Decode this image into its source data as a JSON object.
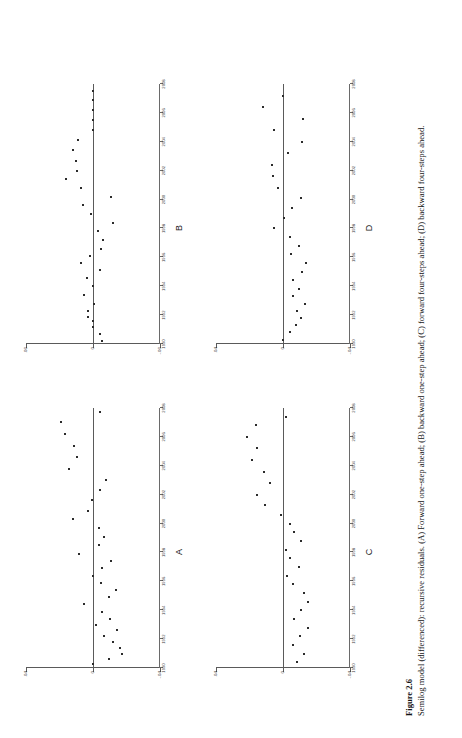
{
  "figure": {
    "number_label": "Figure 2.6",
    "caption": "Semilog model (differenced): recursive residuals. (A) Forward one-step ahead; (B) backward one-step ahead; (C) forward four-steps ahead; (D) backward four-steps ahead."
  },
  "chart_data": [
    {
      "type": "scatter",
      "title": "A",
      "subtitle": "Forward one-step ahead",
      "xlabel": "",
      "ylabel": "",
      "xlim": [
        1990,
        2008
      ],
      "ylim": [
        -0.04,
        0.04
      ],
      "xticks": [
        1990,
        1992,
        1994,
        1996,
        1998,
        2000,
        2002,
        2004,
        2006,
        2008
      ],
      "xticklabels": [
        "1990",
        "1992",
        "1994",
        "1996",
        "1998",
        "2000",
        "2002",
        "2004",
        "2006",
        "2008"
      ],
      "yticks": [
        -0.04,
        0,
        0.04
      ],
      "yticklabels": [
        "-.04",
        "0",
        ".04"
      ],
      "grid": false,
      "zero_line": 0,
      "x": [
        1990.3,
        1990.6,
        1991.0,
        1991.4,
        1991.8,
        1992.2,
        1992.6,
        1993.0,
        1993.4,
        1993.9,
        1994.4,
        1994.9,
        1995.4,
        1995.9,
        1996.4,
        1996.9,
        1997.4,
        1997.9,
        1998.5,
        1999.1,
        1999.7,
        2000.3,
        2000.9,
        2001.6,
        2002.3,
        2003.0,
        2003.8,
        2004.6,
        2005.4,
        2006.2,
        2007.0,
        2007.7
      ],
      "y": [
        0.0,
        -0.0098,
        -0.0172,
        -0.016,
        -0.012,
        -0.0066,
        -0.0142,
        -0.002,
        -0.0102,
        -0.0056,
        0.0056,
        -0.0094,
        -0.0136,
        -0.0046,
        0.0,
        -0.0054,
        -0.011,
        0.0082,
        -0.0038,
        -0.0066,
        -0.0036,
        0.012,
        0.003,
        0.0004,
        -0.004,
        -0.008,
        0.0146,
        0.0098,
        0.0112,
        0.017,
        0.019,
        -0.004
      ]
    },
    {
      "type": "scatter",
      "title": "B",
      "subtitle": "Backward one-step ahead",
      "xlabel": "",
      "ylabel": "",
      "xlim": [
        1990,
        2008
      ],
      "ylim": [
        -0.06,
        0.06
      ],
      "xticks": [
        1990,
        1992,
        1994,
        1996,
        1998,
        2000,
        2002,
        2004,
        2006,
        2008
      ],
      "xticklabels": [
        "1990",
        "1992",
        "1994",
        "1996",
        "1998",
        "2000",
        "2002",
        "2004",
        "2006",
        "2008"
      ],
      "yticks": [
        -0.06,
        0,
        0.06
      ],
      "yticklabels": [
        "-.06",
        "0",
        ".06"
      ],
      "grid": false,
      "zero_line": 0,
      "x": [
        1990.2,
        1990.7,
        1991.2,
        1991.6,
        1991.9,
        1992.3,
        1992.8,
        1993.4,
        1994.0,
        1994.6,
        1995.1,
        1995.6,
        1996.1,
        1996.6,
        1997.2,
        1997.8,
        1998.4,
        1999.0,
        1999.6,
        2000.2,
        2000.8,
        2001.4,
        2002.0,
        2002.7,
        2003.4,
        2004.1,
        2004.8,
        2005.5,
        2006.2,
        2006.9,
        2007.5
      ],
      "y": [
        -0.0078,
        -0.0066,
        -0.0004,
        -0.0004,
        0.0044,
        0.0048,
        -0.001,
        0.0084,
        0.0,
        0.0054,
        -0.0064,
        0.011,
        0.0026,
        -0.0074,
        -0.0094,
        -0.0046,
        -0.0178,
        0.0014,
        0.0092,
        -0.016,
        0.0108,
        0.0238,
        0.0146,
        0.015,
        0.018,
        0.013,
        0.0,
        0.0,
        0.0,
        0.0,
        0.0
      ]
    },
    {
      "type": "scatter",
      "title": "C",
      "subtitle": "Forward four-steps ahead",
      "xlabel": "",
      "ylabel": "",
      "xlim": [
        1990,
        2008
      ],
      "ylim": [
        -0.04,
        0.04
      ],
      "xticks": [
        1990,
        1992,
        1994,
        1996,
        1998,
        2000,
        2002,
        2004,
        2006,
        2008
      ],
      "xticklabels": [
        "1990",
        "1992",
        "1994",
        "1996",
        "1998",
        "2000",
        "2002",
        "2004",
        "2006",
        "2008"
      ],
      "yticks": [
        -0.04,
        0,
        0.04
      ],
      "yticklabels": [
        "-.04",
        "0",
        ".04"
      ],
      "grid": false,
      "zero_line": 0,
      "x": [
        1990.4,
        1991.0,
        1991.6,
        1992.2,
        1992.8,
        1993.4,
        1994.0,
        1994.6,
        1995.2,
        1995.8,
        1996.4,
        1997.0,
        1997.6,
        1998.2,
        1998.8,
        1999.4,
        2000.0,
        2000.6,
        2001.3,
        2002.0,
        2002.8,
        2003.6,
        2004.4,
        2005.2,
        2006.0,
        2006.8,
        2007.4
      ],
      "y": [
        -0.0086,
        -0.0124,
        -0.006,
        -0.01,
        -0.0148,
        -0.0068,
        -0.0108,
        -0.0148,
        -0.0128,
        -0.0062,
        -0.0022,
        -0.0096,
        -0.0044,
        -0.002,
        -0.0108,
        -0.0064,
        -0.004,
        0.0012,
        0.011,
        0.0154,
        0.008,
        0.0112,
        0.0184,
        0.0156,
        0.0212,
        0.0164,
        -0.002
      ]
    },
    {
      "type": "scatter",
      "title": "D",
      "subtitle": "Backward four-steps ahead",
      "xlabel": "",
      "ylabel": "",
      "xlim": [
        1990,
        2008
      ],
      "ylim": [
        -0.04,
        0.04
      ],
      "xticks": [
        1990,
        1992,
        1994,
        1996,
        1998,
        2000,
        2002,
        2004,
        2006,
        2008
      ],
      "xticklabels": [
        "1990",
        "1992",
        "1994",
        "1996",
        "1998",
        "2000",
        "2002",
        "2004",
        "2006",
        "2008"
      ],
      "yticks": [
        -0.04,
        0,
        0.04
      ],
      "yticklabels": [
        "-.04",
        "0",
        ".04"
      ],
      "grid": false,
      "zero_line": 0,
      "x": [
        1990.3,
        1990.8,
        1991.3,
        1991.8,
        1992.3,
        1992.8,
        1993.3,
        1993.8,
        1994.4,
        1995.0,
        1995.6,
        1996.2,
        1996.8,
        1997.4,
        1998.0,
        1998.7,
        1999.4,
        2000.1,
        2000.8,
        2001.6,
        2002.4,
        2003.2,
        2004.0,
        2004.8,
        2005.6,
        2006.4,
        2007.2
      ],
      "y": [
        0.0,
        -0.0042,
        -0.0076,
        -0.0108,
        -0.0084,
        -0.0132,
        -0.0062,
        -0.0096,
        -0.0062,
        -0.0114,
        -0.014,
        -0.0048,
        -0.0096,
        -0.0042,
        0.0054,
        -0.0006,
        -0.0056,
        -0.011,
        0.003,
        0.0062,
        0.0068,
        -0.003,
        -0.0112,
        0.0052,
        -0.0122,
        0.012,
        0.0
      ]
    }
  ]
}
